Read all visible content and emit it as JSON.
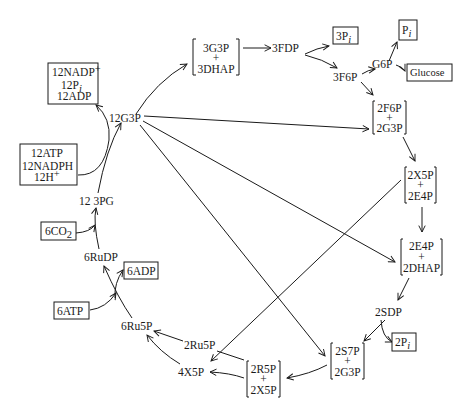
{
  "nodes": {
    "g3p_12": "12G3P",
    "pg3_12": "12 3PG",
    "rudp_6": "6RuDP",
    "ru5p_6": "6Ru5P",
    "ru5p_2": "2Ru5P",
    "x5p_4": "4X5P",
    "fdp_3": "3FDP",
    "f6p_3": "3F6P",
    "g6p": "G6P",
    "sdp_2": "2SDP"
  },
  "boxes": {
    "nadp_out": {
      "line1": "12NADP",
      "sup1": "+",
      "line2": "12P",
      "sub2": "i",
      "line3": "12ADP"
    },
    "atp_in": {
      "line1": "12ATP",
      "line2": "12NADPH",
      "line3": "12H",
      "sup3": "+"
    },
    "co2": {
      "main": "6CO",
      "sub": "2"
    },
    "adp6": "6ADP",
    "atp6": "6ATP",
    "pi3": {
      "main": "3P",
      "sub": "i"
    },
    "pi": {
      "main": "P",
      "sub": "i"
    },
    "glucose": "Glucose",
    "pi2": {
      "main": "2P",
      "sub": "i"
    }
  },
  "brackets": {
    "g3p_dhap": {
      "top": "3G3P",
      "plus": "+",
      "bottom": "3DHAP"
    },
    "f6p_g3p": {
      "top": "2F6P",
      "plus": "+",
      "bottom": "2G3P"
    },
    "x5p_e4p": {
      "top": "2X5P",
      "plus": "+",
      "bottom": "2E4P"
    },
    "e4p_dhap": {
      "top": "2E4P",
      "plus": "+",
      "bottom": "2DHAP"
    },
    "s7p_g3p": {
      "top": "2S7P",
      "plus": "+",
      "bottom": "2G3P"
    },
    "r5p_x5p": {
      "top": "2R5P",
      "plus": "+",
      "bottom": "2X5P"
    }
  }
}
